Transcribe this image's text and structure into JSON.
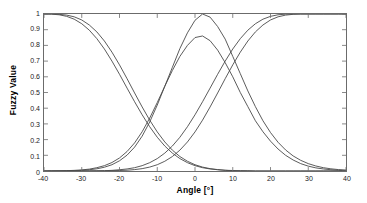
{
  "chart_data": {
    "type": "line",
    "title": "",
    "xlabel": "Angle [°]",
    "ylabel": "Fuzzy Value",
    "xlim": [
      -40,
      40
    ],
    "ylim": [
      0,
      1
    ],
    "grid": false,
    "legend": null,
    "xticks": [
      "-40",
      "-30",
      "-20",
      "-10",
      "0",
      "10",
      "20",
      "30",
      "40"
    ],
    "xtick_values": [
      -40,
      -30,
      -20,
      -10,
      0,
      10,
      20,
      30,
      40
    ],
    "yticks": [
      "0",
      "0.1",
      "0.2",
      "0.3",
      "0.4",
      "0.5",
      "0.6",
      "0.7",
      "0.8",
      "0.9",
      "1"
    ],
    "ytick_values": [
      0,
      0.1,
      0.2,
      0.3,
      0.4,
      0.5,
      0.6,
      0.7,
      0.8,
      0.9,
      1
    ],
    "line_color": "#4a4a4a",
    "axis_color": "#6b6b6b",
    "x": [
      -40,
      -38,
      -36,
      -34,
      -32,
      -30,
      -28,
      -26,
      -24,
      -22,
      -20,
      -18,
      -16,
      -14,
      -12,
      -10,
      -8,
      -6,
      -4,
      -2,
      0,
      2,
      4,
      6,
      8,
      10,
      12,
      14,
      16,
      18,
      20,
      22,
      24,
      26,
      28,
      30,
      32,
      34,
      36,
      38,
      40
    ],
    "series": [
      {
        "name": "Negative Large A",
        "values": [
          1.0,
          1.0,
          0.998,
          0.993,
          0.982,
          0.962,
          0.93,
          0.886,
          0.828,
          0.757,
          0.676,
          0.588,
          0.497,
          0.408,
          0.324,
          0.249,
          0.185,
          0.133,
          0.092,
          0.062,
          0.04,
          0.025,
          0.015,
          0.009,
          0.005,
          0.003,
          0.002,
          0.001,
          0.0,
          0.0,
          0.0,
          0.0,
          0.0,
          0.0,
          0.0,
          0.0,
          0.0,
          0.0,
          0.0,
          0.0,
          0.0
        ]
      },
      {
        "name": "Negative Large B",
        "values": [
          1.0,
          0.999,
          0.995,
          0.985,
          0.967,
          0.938,
          0.897,
          0.843,
          0.777,
          0.7,
          0.616,
          0.528,
          0.441,
          0.358,
          0.282,
          0.215,
          0.159,
          0.114,
          0.079,
          0.053,
          0.034,
          0.021,
          0.013,
          0.008,
          0.004,
          0.002,
          0.001,
          0.001,
          0.0,
          0.0,
          0.0,
          0.0,
          0.0,
          0.0,
          0.0,
          0.0,
          0.0,
          0.0,
          0.0,
          0.0,
          0.0
        ]
      },
      {
        "name": "Negative Small",
        "values": [
          0.0,
          0.0,
          0.001,
          0.002,
          0.004,
          0.007,
          0.012,
          0.021,
          0.034,
          0.054,
          0.083,
          0.124,
          0.179,
          0.25,
          0.337,
          0.436,
          0.54,
          0.64,
          0.73,
          0.8,
          0.85,
          0.86,
          0.83,
          0.77,
          0.69,
          0.6,
          0.5,
          0.41,
          0.32,
          0.25,
          0.19,
          0.14,
          0.1,
          0.07,
          0.047,
          0.031,
          0.02,
          0.013,
          0.008,
          0.005,
          0.003
        ]
      },
      {
        "name": "Zero",
        "values": [
          0.0,
          0.0,
          0.0,
          0.001,
          0.002,
          0.004,
          0.008,
          0.014,
          0.024,
          0.04,
          0.065,
          0.101,
          0.152,
          0.222,
          0.312,
          0.42,
          0.54,
          0.66,
          0.78,
          0.88,
          0.96,
          1.0,
          0.98,
          0.92,
          0.84,
          0.73,
          0.62,
          0.51,
          0.41,
          0.32,
          0.245,
          0.183,
          0.134,
          0.096,
          0.068,
          0.047,
          0.032,
          0.021,
          0.014,
          0.009,
          0.006
        ]
      },
      {
        "name": "Positive Large A",
        "values": [
          0.0,
          0.0,
          0.0,
          0.0,
          0.0,
          0.0,
          0.0,
          0.001,
          0.001,
          0.002,
          0.003,
          0.005,
          0.009,
          0.015,
          0.025,
          0.04,
          0.062,
          0.092,
          0.133,
          0.185,
          0.249,
          0.324,
          0.408,
          0.497,
          0.588,
          0.676,
          0.757,
          0.828,
          0.886,
          0.93,
          0.962,
          0.982,
          0.993,
          0.998,
          1.0,
          1.0,
          1.0,
          1.0,
          1.0,
          1.0,
          1.0
        ]
      },
      {
        "name": "Positive Large B",
        "values": [
          0.0,
          0.0,
          0.0,
          0.0,
          0.0,
          0.0,
          0.001,
          0.001,
          0.002,
          0.004,
          0.008,
          0.013,
          0.021,
          0.034,
          0.053,
          0.079,
          0.114,
          0.159,
          0.215,
          0.282,
          0.358,
          0.441,
          0.528,
          0.616,
          0.7,
          0.777,
          0.843,
          0.897,
          0.938,
          0.967,
          0.985,
          0.995,
          0.999,
          1.0,
          1.0,
          1.0,
          1.0,
          1.0,
          1.0,
          1.0,
          1.0
        ]
      }
    ]
  }
}
